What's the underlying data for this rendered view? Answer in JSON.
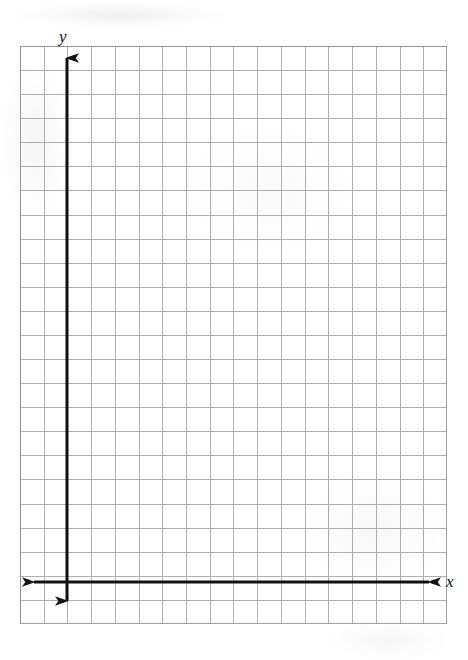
{
  "figure": {
    "type": "blank-coordinate-grid",
    "background_color": "#ffffff"
  },
  "grid": {
    "columns": 18,
    "rows": 24,
    "cell_width_px": 23.7,
    "cell_height_px": 24.1,
    "left_px": 20,
    "top_px": 46,
    "right_px": 447,
    "bottom_px": 624,
    "line_color": "#9a9a9a",
    "border_color": "#8f8f8f"
  },
  "axes": {
    "color": "#111111",
    "stroke_width": 3,
    "y_axis": {
      "label": "y",
      "x_px": 67,
      "top_px": 46,
      "bottom_px": 613,
      "arrow_up": true,
      "arrow_down": true
    },
    "x_axis": {
      "label": "x",
      "y_px": 582,
      "left_px": 22,
      "right_px": 441,
      "arrow_left": true,
      "arrow_right": true
    },
    "origin": {
      "x_px": 67,
      "y_px": 582
    }
  },
  "chart_data": {
    "type": "scatter",
    "title": "",
    "xlabel": "x",
    "ylabel": "y",
    "series": [],
    "x": [],
    "values": [],
    "grid": true,
    "legend": false,
    "xlim": [
      -2,
      16
    ],
    "ylim": [
      -2,
      22
    ]
  }
}
